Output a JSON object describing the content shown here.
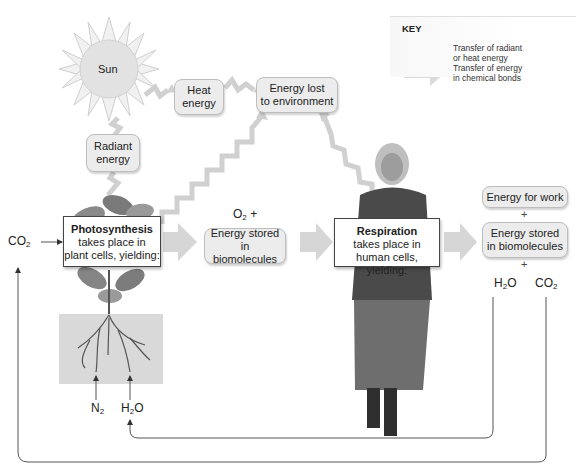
{
  "diagram": {
    "type": "energy-flow"
  },
  "sun": {
    "label": "Sun",
    "icon": "sun-icon"
  },
  "energy_boxes": {
    "radiant": "Radiant energy",
    "radiant_l1": "Radiant",
    "radiant_l2": "energy",
    "heat_l1": "Heat",
    "heat_l2": "energy",
    "lost_l1": "Energy lost",
    "lost_l2": "to environment",
    "stored_l1": "Energy stored in",
    "stored_l2": "biomolecules",
    "work": "Energy for work",
    "stored2_l1": "Energy stored",
    "stored2_l2": "in biomolecules"
  },
  "photosynthesis": {
    "title": "Photosynthesis",
    "line1": "takes place in",
    "line2": "plant cells, yielding:"
  },
  "respiration": {
    "title": "Respiration",
    "line1": "takes place in",
    "line2": "human cells, yielding:"
  },
  "chemicals": {
    "co2_in": {
      "base": "CO",
      "sub": "2"
    },
    "o2": {
      "base": "O",
      "sub": "2",
      "suffix": " +"
    },
    "n2": {
      "base": "N",
      "sub": "2"
    },
    "h2o_in": {
      "pre": "H",
      "sub": "2",
      "post": "O"
    },
    "h2o_out": {
      "pre": "H",
      "sub": "2",
      "post": "O"
    },
    "co2_out": {
      "base": "CO",
      "sub": "2"
    }
  },
  "plus_signs": [
    "+",
    "+"
  ],
  "key": {
    "title": "KEY",
    "radiant_l1": "Transfer of radiant",
    "radiant_l2": "or heat energy",
    "chemical_l1": "Transfer of energy",
    "chemical_l2": "in chemical bonds"
  },
  "colors": {
    "box_fill": "#ececec",
    "arrow_gray": "#cfcfcf",
    "sun_fill": "#e6e6e6",
    "line": "#555555"
  }
}
